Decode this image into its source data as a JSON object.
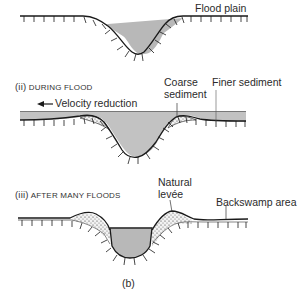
{
  "figure": {
    "caption": "(b)",
    "colors": {
      "water": "#b8b8b8",
      "line": "#1a1a1a",
      "flood_water": "#c4c4c4",
      "sediment_fill": "#eeeeee"
    }
  },
  "panel1": {
    "label": "Flood plain"
  },
  "panel2": {
    "roman": "(ii)",
    "title": "DURING FLOOD",
    "arrow_label": "Velocity reduction",
    "coarse_label_line1": "Coarse",
    "coarse_label_line2": "sediment",
    "finer_label": "Finer sediment"
  },
  "panel3": {
    "roman": "(iii)",
    "title": "AFTER MANY FLOODS",
    "levee_label_line1": "Natural",
    "levee_label_line2": "levée",
    "backswamp_label": "Backswamp area"
  }
}
